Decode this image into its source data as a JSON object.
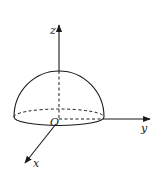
{
  "figure": {
    "axes": {
      "x": {
        "label": "x"
      },
      "y": {
        "label": "y"
      },
      "z": {
        "label": "z"
      }
    },
    "origin_label": "O",
    "colors": {
      "stroke": "#1a1a1a",
      "background": "#ffffff"
    }
  }
}
